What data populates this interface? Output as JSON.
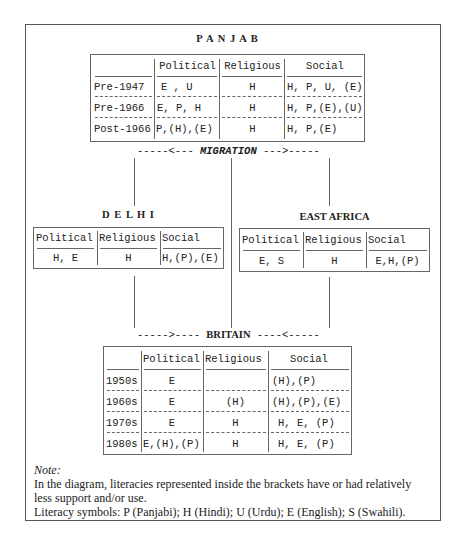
{
  "panjab": {
    "title": "P A N J A B",
    "headers": [
      "",
      "Political",
      "Religious",
      "Social"
    ],
    "rows": [
      {
        "label": "Pre-1947",
        "political": "E , U",
        "religious": "H",
        "social": "H, P, U, (E)"
      },
      {
        "label": "Pre-1966",
        "political": "E, P, H",
        "religious": "H",
        "social": "H, P,(E),(U)"
      },
      {
        "label": "Post-1966",
        "political": "P,(H),(E)",
        "religious": "H",
        "social": "H, P,(E)"
      }
    ]
  },
  "migration_label": "-----<--- MIGRATION --->-----",
  "migration": {
    "left": "-----<--- ",
    "word": "MIGRATION",
    "right": " --->-----"
  },
  "delhi": {
    "title": "D E L H I",
    "headers": [
      "Political",
      "Religious",
      "Social"
    ],
    "row": {
      "political": "H, E",
      "religious": "H",
      "social": "H,(P),(E)"
    }
  },
  "east_africa": {
    "title": "EAST AFRICA",
    "headers": [
      "Political",
      "Religious",
      "Social"
    ],
    "row": {
      "political": "E, S",
      "religious": "H",
      "social": "E,H,(P)"
    }
  },
  "britain_arrow": {
    "left": "----->---- ",
    "word": "BRITAIN",
    "right": " ----<-----"
  },
  "britain": {
    "headers": [
      "",
      "Political",
      "Religious",
      "Social"
    ],
    "rows": [
      {
        "label": "1950s",
        "political": "E",
        "religious": "",
        "social": "(H),(P)"
      },
      {
        "label": "1960s",
        "political": "E",
        "religious": "(H)",
        "social": "(H),(P),(E)"
      },
      {
        "label": "1970s",
        "political": "E",
        "religious": "H",
        "social": "H, E, (P)"
      },
      {
        "label": "1980s",
        "political": "E,(H),(P)",
        "religious": "H",
        "social": "H, E, (P)"
      }
    ]
  },
  "note": {
    "heading": "Note:",
    "line1": "In the diagram, literacies represented inside the brackets have or had relatively",
    "line2": "less support and/or use.",
    "line3": "Literacy symbols: P (Panjabi); H (Hindi); U (Urdu); E (English); S (Swahili)."
  }
}
